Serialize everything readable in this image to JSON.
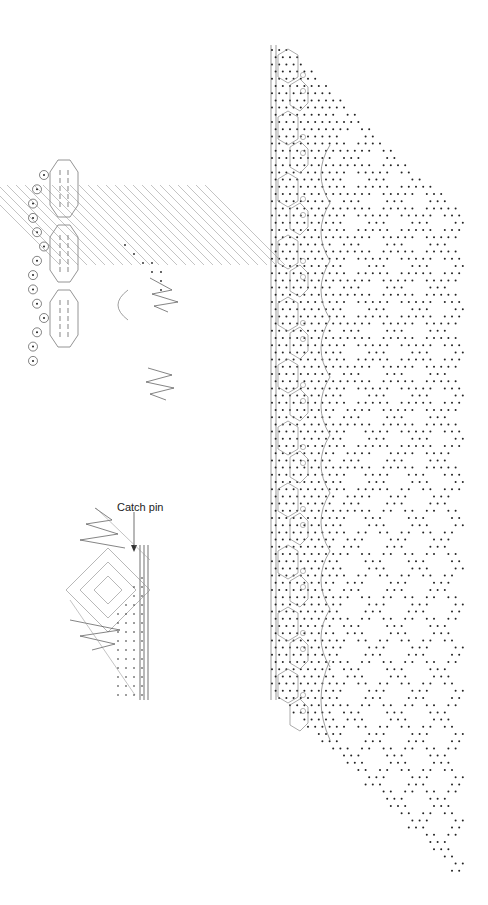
{
  "figure": {
    "type": "bobbin lace pricking and working diagrams",
    "panels": [
      {
        "id": "diagram-top-left",
        "description": "Working diagram of heading with pinholes, cloth-stitch trails and ground"
      },
      {
        "id": "diagram-bottom-left",
        "description": "Corner working diagram with catch pin",
        "annotation": "Catch pin"
      },
      {
        "id": "pricking-right",
        "description": "Full-length pricking with headside, curved trails and diamond ground pattern"
      }
    ]
  },
  "labels": {
    "catch_pin": "Catch pin"
  },
  "colors": {
    "dots": "#222222",
    "lines": "#888888",
    "dark_lines": "#333333",
    "background": "#ffffff"
  }
}
